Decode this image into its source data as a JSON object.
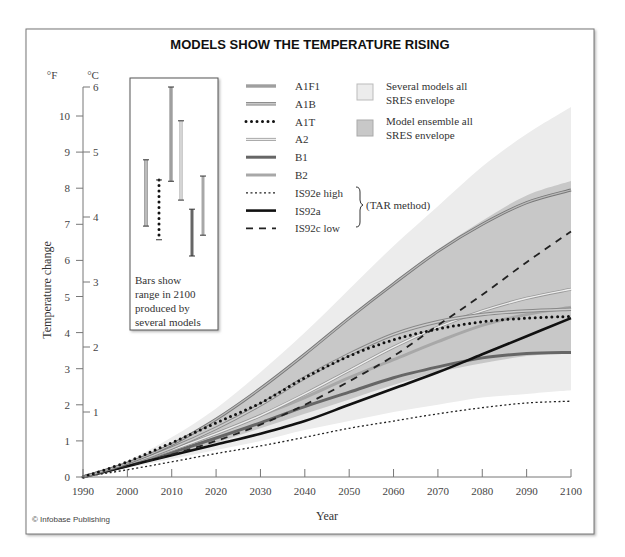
{
  "chart_data": {
    "type": "line",
    "title": "MODELS SHOW THE TEMPERATURE RISING",
    "xlabel": "Year",
    "ylabel": "Temperature change",
    "x_ticks": [
      1990,
      2000,
      2010,
      2020,
      2030,
      2040,
      2050,
      2060,
      2070,
      2080,
      2090,
      2100
    ],
    "y_ticks_f": [
      0,
      1,
      2,
      3,
      4,
      5,
      6,
      7,
      8,
      9,
      10
    ],
    "y_ticks_c": [
      1,
      2,
      3,
      4,
      5,
      6
    ],
    "y_unit_f": "°F",
    "y_unit_c": "°C",
    "xlim": [
      1990,
      2100
    ],
    "ylim_f": [
      0,
      10.8
    ],
    "grid": false,
    "x": [
      1990,
      2000,
      2010,
      2020,
      2030,
      2040,
      2050,
      2060,
      2070,
      2080,
      2090,
      2100
    ],
    "envelopes": [
      {
        "name": "Several models all SRES envelope",
        "color": "#ececec",
        "upper": [
          0,
          0.45,
          1.1,
          1.9,
          2.9,
          4.0,
          5.2,
          6.4,
          7.5,
          8.6,
          9.5,
          10.25
        ],
        "lower": [
          0,
          0.25,
          0.5,
          0.75,
          1.0,
          1.3,
          1.55,
          1.8,
          2.0,
          2.2,
          2.3,
          2.4
        ]
      },
      {
        "name": "Model ensemble all SRES envelope",
        "color": "#c8c8c8",
        "upper": [
          0,
          0.4,
          0.95,
          1.65,
          2.5,
          3.45,
          4.45,
          5.4,
          6.3,
          7.1,
          7.8,
          8.2
        ],
        "lower": [
          0,
          0.3,
          0.6,
          0.95,
          1.35,
          1.75,
          2.15,
          2.55,
          2.9,
          3.15,
          3.35,
          3.45
        ]
      }
    ],
    "series": [
      {
        "name": "A1F1",
        "style": "grey-dotted-double",
        "values": [
          0,
          0.38,
          0.9,
          1.6,
          2.45,
          3.4,
          4.4,
          5.35,
          6.25,
          7.0,
          7.6,
          7.95
        ]
      },
      {
        "name": "A1B",
        "style": "grey-double",
        "values": [
          0,
          0.35,
          0.8,
          1.35,
          2.0,
          2.75,
          3.4,
          3.95,
          4.3,
          4.5,
          4.6,
          4.65
        ]
      },
      {
        "name": "A1T",
        "style": "black-dots",
        "values": [
          0,
          0.42,
          0.95,
          1.5,
          2.05,
          2.75,
          3.35,
          3.8,
          4.1,
          4.3,
          4.4,
          4.45
        ]
      },
      {
        "name": "A2",
        "style": "thin-grey-double",
        "values": [
          0,
          0.35,
          0.75,
          1.2,
          1.7,
          2.3,
          2.95,
          3.6,
          4.15,
          4.6,
          4.95,
          5.2
        ]
      },
      {
        "name": "B1",
        "style": "dark-grey-thick",
        "values": [
          0,
          0.32,
          0.68,
          1.08,
          1.5,
          1.95,
          2.35,
          2.75,
          3.05,
          3.3,
          3.42,
          3.45
        ]
      },
      {
        "name": "B2",
        "style": "light-grey-thick",
        "values": [
          0,
          0.35,
          0.75,
          1.2,
          1.7,
          2.2,
          2.75,
          3.25,
          3.75,
          4.2,
          4.5,
          4.7
        ]
      },
      {
        "name": "IS92e high",
        "style": "fine-dotted",
        "values": [
          0,
          0.2,
          0.42,
          0.65,
          0.86,
          1.1,
          1.35,
          1.55,
          1.75,
          1.92,
          2.05,
          2.1
        ]
      },
      {
        "name": "IS92a",
        "style": "black-solid",
        "values": [
          0,
          0.3,
          0.6,
          0.9,
          1.2,
          1.55,
          2.0,
          2.45,
          2.9,
          3.4,
          3.9,
          4.4
        ]
      },
      {
        "name": "IS92c low",
        "style": "black-dashed",
        "values": [
          0,
          0.3,
          0.62,
          1.0,
          1.45,
          2.0,
          2.65,
          3.35,
          4.2,
          5.05,
          5.95,
          6.8
        ]
      }
    ],
    "range_bars_2100_c": [
      {
        "name": "A1B",
        "low": 3.86,
        "high": 4.88
      },
      {
        "name": "A1T",
        "low": 3.65,
        "high": 4.57
      },
      {
        "name": "A1F1",
        "low": 4.55,
        "high": 6.0
      },
      {
        "name": "A2",
        "low": 4.26,
        "high": 5.48
      },
      {
        "name": "B1",
        "low": 3.4,
        "high": 4.12
      },
      {
        "name": "B2",
        "low": 3.72,
        "high": 4.63
      }
    ],
    "legend_position": "top-center",
    "annotations": [
      "Bars show range in 2100 produced by several models",
      "(TAR method)"
    ]
  },
  "inset": {
    "lines": [
      "Bars show",
      "range in 2100",
      "produced by",
      "several models"
    ]
  },
  "legend": {
    "items": [
      "A1F1",
      "A1B",
      "A1T",
      "A2",
      "B1",
      "B2",
      "IS92e high",
      "IS92a",
      "IS92c low"
    ],
    "envelope_1": [
      "Several models all",
      "SRES envelope"
    ],
    "envelope_2": [
      "Model ensemble all",
      "SRES envelope"
    ],
    "tar_method": "(TAR method)"
  },
  "credit": "© Infobase Publishing"
}
